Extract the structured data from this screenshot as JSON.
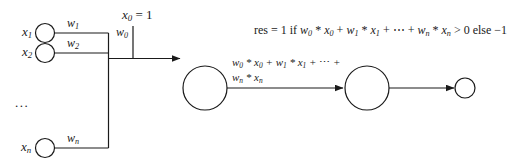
{
  "diagram": {
    "stroke_color": "#1a1a1a",
    "background_color": "#ffffff",
    "inputs": [
      {
        "id": "x1",
        "label_base": "x",
        "label_sub": "1",
        "weight_base": "w",
        "weight_sub": "1"
      },
      {
        "id": "x2",
        "label_base": "x",
        "label_sub": "2",
        "weight_base": "w",
        "weight_sub": "2"
      },
      {
        "id": "xn",
        "label_base": "x",
        "label_sub": "n",
        "weight_base": "w",
        "weight_sub": "n"
      }
    ],
    "ellipsis": "...",
    "bias": {
      "value_label_base": "x",
      "value_label_sub": "0",
      "value_label_rest": " = 1",
      "weight_base": "w",
      "weight_sub": "0"
    },
    "edge_label": {
      "line1_parts": [
        {
          "t": "w",
          "s": "0"
        },
        {
          "t": " * "
        },
        {
          "t": "x",
          "s": "0"
        },
        {
          "t": " + "
        },
        {
          "t": "w",
          "s": "1"
        },
        {
          "t": " * "
        },
        {
          "t": "x",
          "s": "1"
        },
        {
          "t": " + ⋯ +"
        }
      ],
      "line2_parts": [
        {
          "t": "w",
          "s": "n"
        },
        {
          "t": " * "
        },
        {
          "t": "x",
          "s": "n"
        }
      ]
    },
    "result_formula_parts": [
      {
        "t": "res",
        "upright": true
      },
      {
        "t": " = 1 ",
        "upright": true
      },
      {
        "t": "if ",
        "upright": true
      },
      {
        "t": "w",
        "s": "0"
      },
      {
        "t": " * "
      },
      {
        "t": "x",
        "s": "0"
      },
      {
        "t": " + "
      },
      {
        "t": "w",
        "s": "1"
      },
      {
        "t": " * "
      },
      {
        "t": "x",
        "s": "1"
      },
      {
        "t": " + ⋯ + "
      },
      {
        "t": "w",
        "s": "n"
      },
      {
        "t": " * "
      },
      {
        "t": "x",
        "s": "n"
      },
      {
        "t": " > 0 ",
        "upright": true
      },
      {
        "t": "else −1",
        "upright": true
      }
    ],
    "nodes": {
      "sum_node": "summation-neuron",
      "activation_node": "activation-neuron",
      "output_node": "output-node"
    }
  }
}
